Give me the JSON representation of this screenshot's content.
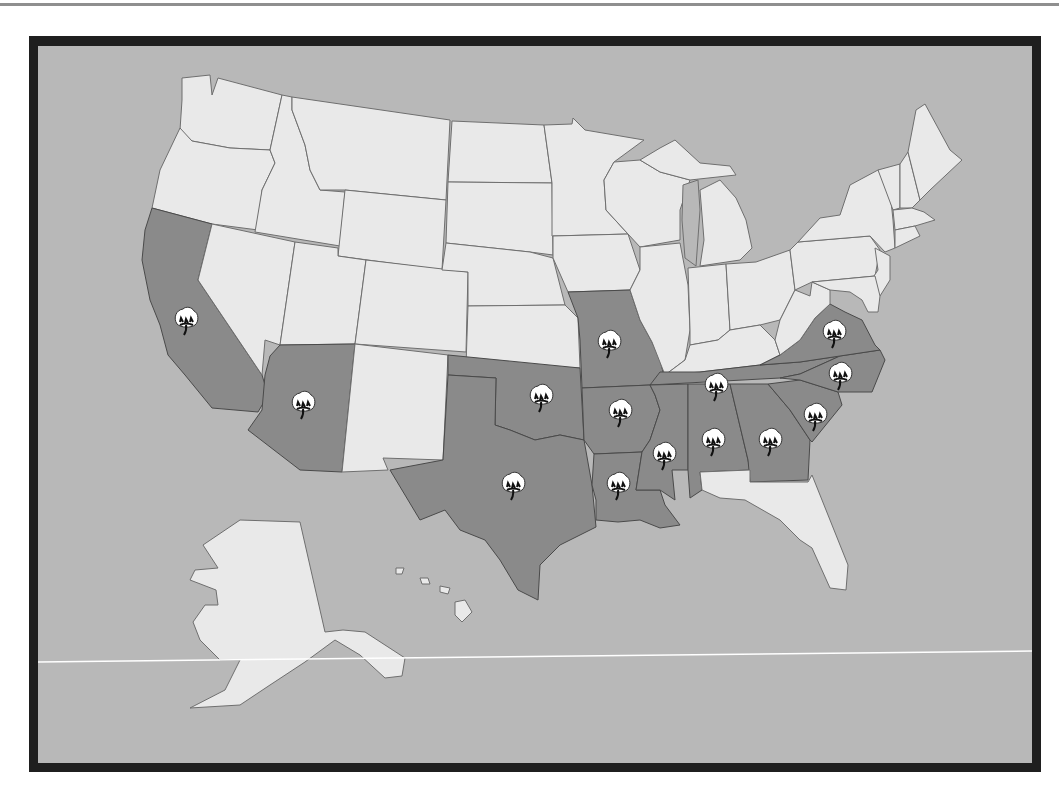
{
  "map": {
    "title": "",
    "subject": "Cotton-producing states of the United States",
    "colors": {
      "background_page": "#ffffff",
      "frame_border": "#1f1f1f",
      "water": "#b8b8b8",
      "non_cotton_state": "#e9e9e9",
      "cotton_state": "#8a8a8a",
      "state_border": "#6f6f6f"
    },
    "legend": [],
    "icon": "cotton-boll-icon",
    "highlighted_states": [
      "California",
      "Arizona",
      "Texas",
      "Oklahoma",
      "Missouri",
      "Arkansas",
      "Louisiana",
      "Mississippi",
      "Alabama",
      "Tennessee",
      "Georgia",
      "South Carolina",
      "North Carolina",
      "Virginia"
    ],
    "other_states_shown": [
      "Washington",
      "Oregon",
      "Idaho",
      "Montana",
      "Nevada",
      "Utah",
      "Wyoming",
      "Colorado",
      "New Mexico",
      "North Dakota",
      "South Dakota",
      "Nebraska",
      "Kansas",
      "Minnesota",
      "Iowa",
      "Wisconsin",
      "Illinois",
      "Michigan",
      "Indiana",
      "Ohio",
      "Kentucky",
      "West Virginia",
      "Pennsylvania",
      "New York",
      "Vermont",
      "New Hampshire",
      "Maine",
      "Massachusetts",
      "Connecticut",
      "Rhode Island",
      "New Jersey",
      "Delaware",
      "Maryland",
      "Florida",
      "Alaska",
      "Hawaii"
    ],
    "cotton_markers": [
      {
        "state": "California",
        "x": 186,
        "y": 320
      },
      {
        "state": "Arizona",
        "x": 303,
        "y": 404
      },
      {
        "state": "Texas",
        "x": 513,
        "y": 485
      },
      {
        "state": "Oklahoma",
        "x": 541,
        "y": 397
      },
      {
        "state": "Missouri",
        "x": 609,
        "y": 343
      },
      {
        "state": "Arkansas",
        "x": 620,
        "y": 412
      },
      {
        "state": "Louisiana",
        "x": 618,
        "y": 485
      },
      {
        "state": "Mississippi",
        "x": 664,
        "y": 455
      },
      {
        "state": "Alabama",
        "x": 713,
        "y": 441
      },
      {
        "state": "Tennessee",
        "x": 716,
        "y": 386
      },
      {
        "state": "Georgia",
        "x": 770,
        "y": 441
      },
      {
        "state": "South Carolina",
        "x": 815,
        "y": 416
      },
      {
        "state": "North Carolina",
        "x": 840,
        "y": 375
      },
      {
        "state": "Virginia",
        "x": 834,
        "y": 333
      }
    ]
  }
}
